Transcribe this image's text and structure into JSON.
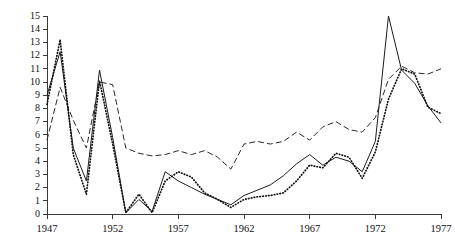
{
  "chart_data": {
    "type": "line",
    "title": "",
    "subtitle": "",
    "xlabel": "",
    "ylabel": "",
    "xlim": [
      1947,
      1977
    ],
    "ylim": [
      0,
      15
    ],
    "grid": false,
    "legend": "none",
    "x_ticks": [
      1947,
      1952,
      1957,
      1962,
      1967,
      1972,
      1977
    ],
    "x_tick_labels": [
      "1947",
      "1952",
      "1957",
      "1962",
      "1967",
      "1972",
      "1977"
    ],
    "x_minor_ticks": [
      1947,
      1948,
      1949,
      1950,
      1951,
      1952,
      1953,
      1954,
      1955,
      1956,
      1957,
      1958,
      1959,
      1960,
      1961,
      1962,
      1963,
      1964,
      1965,
      1966,
      1967,
      1968,
      1969,
      1970,
      1971,
      1972,
      1973,
      1974,
      1975,
      1976,
      1977
    ],
    "y_ticks": [
      0,
      1,
      2,
      3,
      4,
      5,
      6,
      7,
      8,
      9,
      10,
      11,
      12,
      13,
      14,
      15
    ],
    "y_tick_labels": [
      "0",
      "1",
      "2",
      "3",
      "4",
      "5",
      "6",
      "7",
      "8",
      "9",
      "10",
      "11",
      "12",
      "13",
      "14",
      "15"
    ],
    "x": [
      1947,
      1948,
      1949,
      1950,
      1951,
      1952,
      1953,
      1954,
      1955,
      1956,
      1957,
      1958,
      1959,
      1960,
      1961,
      1962,
      1963,
      1964,
      1965,
      1966,
      1967,
      1968,
      1969,
      1970,
      1971,
      1972,
      1973,
      1974,
      1975,
      1976,
      1977
    ],
    "series": [
      {
        "name": "series-solid",
        "style": "solid",
        "color": "#1c1c1c",
        "values": [
          9.0,
          12.3,
          5.0,
          2.5,
          10.9,
          5.8,
          0.1,
          1.1,
          0.2,
          3.2,
          2.5,
          2.0,
          1.5,
          1.1,
          0.7,
          1.4,
          1.8,
          2.2,
          2.9,
          3.8,
          4.5,
          3.7,
          4.3,
          4.0,
          3.2,
          5.5,
          15.0,
          10.9,
          9.9,
          8.2,
          6.9
        ],
        "markers": false
      },
      {
        "name": "series-dashed",
        "style": "dashed",
        "color": "#2a2a2a",
        "values": [
          5.6,
          9.6,
          7.1,
          5.0,
          10.0,
          9.8,
          5.0,
          4.6,
          4.4,
          4.5,
          4.8,
          4.5,
          4.8,
          4.3,
          3.4,
          5.3,
          5.5,
          5.3,
          5.5,
          6.2,
          5.6,
          6.6,
          7.0,
          6.4,
          6.2,
          7.3,
          10.2,
          11.2,
          10.7,
          10.6,
          11.0
        ],
        "markers": false
      },
      {
        "name": "series-dotted",
        "style": "dotted",
        "color": "#111111",
        "values": [
          8.3,
          13.2,
          4.5,
          1.5,
          10.1,
          5.3,
          0.1,
          1.5,
          0.1,
          2.5,
          3.2,
          2.8,
          1.6,
          1.1,
          0.5,
          1.1,
          1.3,
          1.4,
          1.6,
          2.5,
          3.7,
          3.5,
          4.6,
          4.3,
          2.7,
          4.7,
          8.7,
          11.0,
          10.6,
          8.1,
          7.6
        ],
        "markers": false
      }
    ]
  },
  "plot_geometry": {
    "left_px": 47,
    "right_px": 441,
    "top_px": 16,
    "bottom_px": 214
  }
}
